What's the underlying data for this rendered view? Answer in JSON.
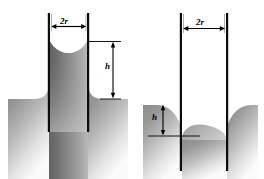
{
  "figure": {
    "background_color": "#ffffff",
    "line_color": "#000000",
    "width": 264,
    "height": 179,
    "panels": [
      {
        "id": "left-panel",
        "name": "capillary-rise-panel",
        "description": "Wetting liquid rises inside the capillary tube; meniscus is concave.",
        "meniscus_shape": "concave",
        "labels": {
          "diameter": "2r",
          "height": "h"
        },
        "tube": {
          "inner_left_x": 50,
          "inner_right_x": 87,
          "top_y": 13,
          "bottom_y": 132,
          "wall_thickness": 2
        },
        "liquid": {
          "reservoir_surface_y": 99,
          "inside_level_y": 40,
          "rise_height_px": 59
        }
      },
      {
        "id": "right-panel",
        "name": "capillary-depression-panel",
        "description": "Non-wetting liquid is depressed inside the capillary tube; meniscus is convex.",
        "meniscus_shape": "convex",
        "labels": {
          "diameter": "2r",
          "height": "h"
        },
        "tube": {
          "inner_left_x": 182,
          "inner_right_x": 226,
          "top_y": 13,
          "bottom_y": 171,
          "wall_thickness": 2
        },
        "liquid": {
          "reservoir_surface_y": 105,
          "inside_level_y": 136,
          "depression_height_px": 31
        }
      }
    ],
    "shading": {
      "liquid_gradient_top": "#8e8e8e",
      "liquid_gradient_bottom": "#fbfbfb",
      "tube_column_gradient_left": "#6f6f6f",
      "tube_column_gradient_right": "#b4b4b4"
    },
    "annotations": {
      "arrow_style": "double-headed",
      "extension_lines": true
    }
  }
}
